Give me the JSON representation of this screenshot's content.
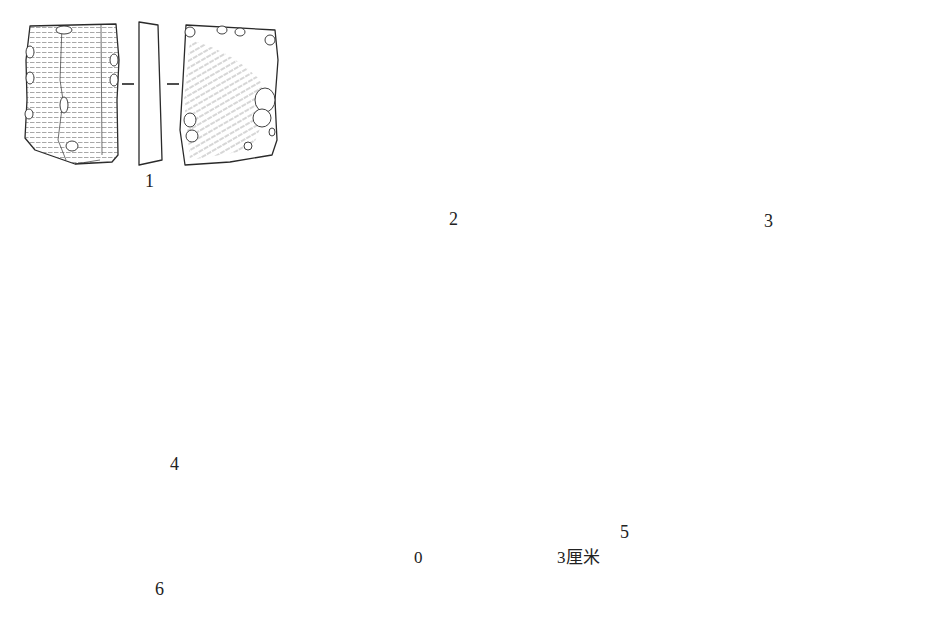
{
  "figure": {
    "artifacts": [
      {
        "id": "1",
        "label": "1",
        "views": [
          "dorsal",
          "section",
          "ventral"
        ]
      },
      {
        "id": "2",
        "label": "2",
        "views": [
          "dorsal",
          "section",
          "ventral"
        ]
      },
      {
        "id": "3",
        "label": "3",
        "views": [
          "dorsal",
          "section",
          "ventral"
        ]
      },
      {
        "id": "4",
        "label": "4",
        "views": [
          "dorsal",
          "section",
          "ventral"
        ]
      },
      {
        "id": "5",
        "label": "5",
        "views": [
          "dorsal",
          "section",
          "ventral"
        ]
      },
      {
        "id": "6",
        "label": "6",
        "views": [
          "dorsal",
          "section",
          "ventral"
        ]
      }
    ],
    "scale_bar": {
      "start_label": "0",
      "end_label": "3厘米",
      "length_cm": 3,
      "divisions": 2
    }
  }
}
